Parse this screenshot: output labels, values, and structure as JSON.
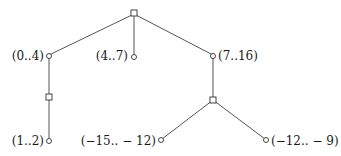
{
  "diagram": {
    "type": "tree",
    "nodes": [
      {
        "id": "root",
        "shape": "square",
        "label": ""
      },
      {
        "id": "n04",
        "shape": "circle",
        "label": "(0..4)"
      },
      {
        "id": "n47",
        "shape": "circle",
        "label": "(4..7)"
      },
      {
        "id": "n716",
        "shape": "circle",
        "label": "(7..16)"
      },
      {
        "id": "sq1",
        "shape": "square",
        "label": ""
      },
      {
        "id": "n12",
        "shape": "circle",
        "label": "(1..2)"
      },
      {
        "id": "sq2",
        "shape": "square",
        "label": ""
      },
      {
        "id": "nm15",
        "shape": "circle",
        "label": "(−15.. − 12)"
      },
      {
        "id": "nm12",
        "shape": "circle",
        "label": "(−12.. − 9)"
      }
    ],
    "edges": [
      [
        "root",
        "n04"
      ],
      [
        "root",
        "n47"
      ],
      [
        "root",
        "n716"
      ],
      [
        "n04",
        "sq1"
      ],
      [
        "sq1",
        "n12"
      ],
      [
        "n716",
        "sq2"
      ],
      [
        "sq2",
        "nm15"
      ],
      [
        "sq2",
        "nm12"
      ]
    ]
  }
}
